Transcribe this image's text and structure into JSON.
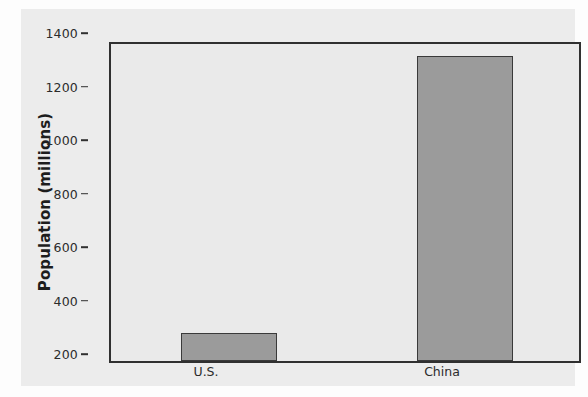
{
  "chart_data": {
    "type": "bar",
    "title": "",
    "subtitle": "",
    "xlabel": "",
    "ylabel": "Population (millions)",
    "categories": [
      "U.S.",
      "China"
    ],
    "values": [
      305,
      1340
    ],
    "series": [
      {
        "name": "Population",
        "values": [
          305,
          1340
        ]
      }
    ],
    "ylim": [
      200,
      1400
    ],
    "yticks": [
      200,
      400,
      600,
      800,
      1000,
      1200,
      1400
    ],
    "ytick_labels": [
      "200",
      "400",
      "600",
      "800",
      "1000",
      "1200",
      "1400"
    ],
    "xtick_labels": [
      "U.S.",
      "China"
    ],
    "grid": false,
    "legend": false,
    "legend_position": "none",
    "colors": {
      "bar_fill": "#9b9b9b",
      "bar_edge": "#3a3a3a",
      "plot_background": "#eaeaea",
      "figure_background": "#ececec",
      "page_background": "#fdfdfd",
      "axis": "#303030",
      "text": "#2b2b2b"
    }
  }
}
